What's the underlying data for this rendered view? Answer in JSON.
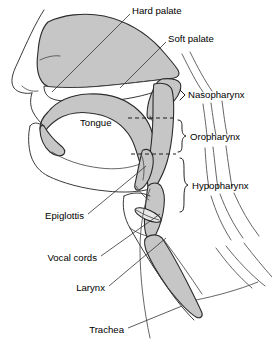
{
  "diagram": {
    "background_color": "#ffffff",
    "tissue_fill_color": "#c6c6c6",
    "outline_color": "#3a3a3a",
    "text_color": "#000000",
    "width": 272,
    "height": 345
  },
  "labels": {
    "hard_palate": "Hard palate",
    "soft_palate": "Soft palate",
    "nasopharynx": "Nasopharynx",
    "oropharynx": "Oropharynx",
    "hypopharynx": "Hypopharynx",
    "tongue": "Tongue",
    "epiglottis": "Epiglottis",
    "vocal_cords": "Vocal cords",
    "larynx": "Larynx",
    "trachea": "Trachea"
  },
  "label_positions": {
    "hard_palate": {
      "x": 132,
      "y": 11,
      "anchor": "start"
    },
    "soft_palate": {
      "x": 168,
      "y": 39,
      "anchor": "start"
    },
    "nasopharynx": {
      "x": 188,
      "y": 95,
      "anchor": "start"
    },
    "oropharynx": {
      "x": 190,
      "y": 137,
      "anchor": "start"
    },
    "hypopharynx": {
      "x": 192,
      "y": 186,
      "anchor": "start"
    },
    "tongue": {
      "x": 80,
      "y": 123,
      "anchor": "start"
    },
    "epiglottis": {
      "x": 84,
      "y": 216,
      "anchor": "end"
    },
    "vocal_cords": {
      "x": 97,
      "y": 258,
      "anchor": "end"
    },
    "larynx": {
      "x": 105,
      "y": 288,
      "anchor": "end"
    },
    "trachea": {
      "x": 124,
      "y": 330,
      "anchor": "end"
    }
  },
  "regions": [
    {
      "name": "nasopharynx",
      "marker": "caret"
    },
    {
      "name": "oropharynx",
      "marker": "brace"
    },
    {
      "name": "hypopharynx",
      "marker": "brace"
    }
  ],
  "structures": [
    "nasal-cavity",
    "hard-palate",
    "soft-palate",
    "tongue",
    "oral-cavity",
    "mandible",
    "epiglottis",
    "vocal-cords",
    "larynx",
    "trachea",
    "pharyngeal-wall",
    "cervical-vertebrae"
  ]
}
